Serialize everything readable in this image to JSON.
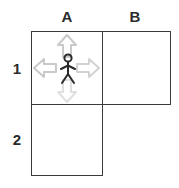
{
  "grid": {
    "column_headers": [
      {
        "label": "A",
        "name": "column-header-a"
      },
      {
        "label": "B",
        "name": "column-header-b"
      }
    ],
    "row_headers": [
      {
        "label": "1",
        "name": "row-header-1"
      },
      {
        "label": "2",
        "name": "row-header-2"
      }
    ],
    "cells": [
      {
        "id": "A1",
        "occupied": true
      },
      {
        "id": "B1",
        "occupied": false
      },
      {
        "id": "A2",
        "occupied": false
      }
    ]
  },
  "player": {
    "icon": "stick-figure-icon",
    "cell": "A1",
    "color": "#2b2b2b"
  },
  "moves": [
    {
      "direction": "up",
      "icon": "arrow-up-icon",
      "color": "#c9c9c9"
    },
    {
      "direction": "left",
      "icon": "arrow-left-icon",
      "color": "#c9c9c9"
    },
    {
      "direction": "right",
      "icon": "arrow-right-icon",
      "color": "#d2d2d2"
    },
    {
      "direction": "down",
      "icon": "arrow-down-icon",
      "color": "#e0e0e0"
    }
  ],
  "colors": {
    "grid_line": "#3a3a3a",
    "label_text": "#2b2b2b",
    "background": "#ffffff"
  }
}
